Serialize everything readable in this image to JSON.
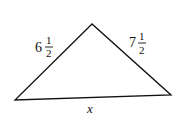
{
  "diagram": {
    "type": "triangle",
    "vertices": {
      "top": [
        92,
        24
      ],
      "left": [
        15,
        100
      ],
      "right": [
        171,
        95
      ]
    },
    "sides": {
      "left": {
        "whole": "6",
        "numerator": "1",
        "denominator": "2",
        "value": "6 1/2"
      },
      "right": {
        "whole": "7",
        "numerator": "1",
        "denominator": "2",
        "value": "7 1/2"
      },
      "bottom": {
        "label": "x"
      }
    },
    "colors": {
      "stroke": "#111111",
      "background": "#ffffff"
    }
  }
}
